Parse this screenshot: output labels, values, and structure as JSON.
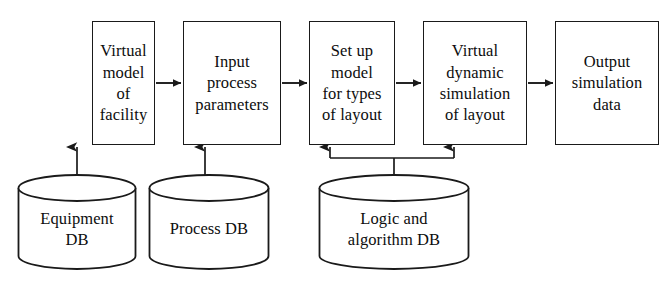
{
  "diagram": {
    "type": "process-flow-with-databases",
    "stroke_color": "#1a1a1a",
    "text_color": "#0d0d0d",
    "background_color": "#ffffff",
    "process_boxes": [
      {
        "id": "virtual-model-of-facility",
        "label": "Virtual\nmodel\nof\nfacility",
        "x": 92,
        "y": 21,
        "width": 63,
        "height": 124
      },
      {
        "id": "input-process-parameters",
        "label": "Input\nprocess\nparameters",
        "x": 183,
        "y": 21,
        "width": 98,
        "height": 124
      },
      {
        "id": "set-up-model-for-types-of-layout",
        "label": "Set up\nmodel\nfor types\nof layout",
        "x": 309,
        "y": 21,
        "width": 86,
        "height": 124
      },
      {
        "id": "virtual-dynamic-simulation-of-layout",
        "label": "Virtual\ndynamic\nsimulation\nof layout",
        "x": 423,
        "y": 21,
        "width": 104,
        "height": 124
      },
      {
        "id": "output-simulation-data",
        "label": "Output\nsimulation\ndata",
        "x": 555,
        "y": 21,
        "width": 104,
        "height": 124
      }
    ],
    "databases": [
      {
        "id": "equipment-db",
        "label": "Equipment\nDB",
        "x": 17,
        "y": 174,
        "width": 120,
        "height": 96,
        "feeds": "virtual-model-of-facility"
      },
      {
        "id": "process-db",
        "label": "Process DB",
        "x": 148,
        "y": 174,
        "width": 122,
        "height": 96,
        "feeds": "input-process-parameters"
      },
      {
        "id": "logic-and-algorithm-db",
        "label": "Logic and\nalgorithm DB",
        "x": 318,
        "y": 174,
        "width": 152,
        "height": 96,
        "feeds": "set-up-model-for-types-of-layout, virtual-dynamic-simulation-of-layout"
      }
    ],
    "flow_arrows": [
      {
        "id": "arrow-box1-to-box2",
        "from": "virtual-model-of-facility",
        "to": "input-process-parameters",
        "x1": 156,
        "x2": 182,
        "y": 83
      },
      {
        "id": "arrow-box2-to-box3",
        "from": "input-process-parameters",
        "to": "set-up-model-for-types-of-layout",
        "x1": 282,
        "x2": 308,
        "y": 83
      },
      {
        "id": "arrow-box3-to-box4",
        "from": "set-up-model-for-types-of-layout",
        "to": "virtual-dynamic-simulation-of-layout",
        "x1": 396,
        "x2": 422,
        "y": 83
      },
      {
        "id": "arrow-box4-to-box5",
        "from": "virtual-dynamic-simulation-of-layout",
        "to": "output-simulation-data",
        "x1": 528,
        "x2": 554,
        "y": 83
      }
    ],
    "feed_arrows": [
      {
        "id": "arrow-equipment-db-to-box1",
        "x": 77,
        "y_top": 146,
        "y_bottom": 200
      },
      {
        "id": "arrow-process-db-to-box2",
        "x": 205,
        "y_top": 146,
        "y_bottom": 200
      },
      {
        "id": "arrow-logic-db-to-box3",
        "x": 330,
        "y_top": 146,
        "y_bottom": 158
      },
      {
        "id": "arrow-logic-db-to-box4",
        "x": 454,
        "y_top": 146,
        "y_bottom": 158
      }
    ],
    "branch_bus": {
      "id": "logic-db-branch-bus",
      "y": 158,
      "x_left": 330,
      "x_right": 454,
      "stem_x": 394,
      "stem_y_bottom": 210
    }
  }
}
